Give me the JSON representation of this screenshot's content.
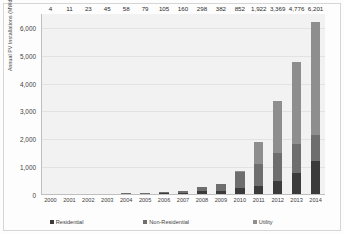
{
  "chart_data": {
    "type": "bar",
    "subtype": "stacked-bar",
    "title": "",
    "xlabel": "",
    "ylabel": "Annual PV Installations (MWdc)",
    "ylim": [
      0,
      6500
    ],
    "yticks": [
      0,
      1000,
      2000,
      3000,
      4000,
      5000,
      6000
    ],
    "ytick_labels": [
      "0",
      "1,000",
      "2,000",
      "3,000",
      "4,000",
      "5,000",
      "6,000"
    ],
    "grid": true,
    "legend_position": "bottom",
    "categories": [
      "2000",
      "2001",
      "2002",
      "2003",
      "2004",
      "2005",
      "2006",
      "2007",
      "2008",
      "2009",
      "2010",
      "2011",
      "2012",
      "2013",
      "2014"
    ],
    "totals": [
      4,
      11,
      23,
      45,
      58,
      79,
      105,
      160,
      298,
      382,
      852,
      1922,
      3369,
      4776,
      6201
    ],
    "total_labels": [
      "4",
      "11",
      "23",
      "45",
      "58",
      "79",
      "105",
      "160",
      "298",
      "382",
      "852",
      "1,922",
      "3,369",
      "4,776",
      "6,201"
    ],
    "series": [
      {
        "name": "Residential",
        "color": "#3b3b3b",
        "values": [
          2,
          6,
          13,
          24,
          32,
          43,
          56,
          78,
          130,
          162,
          253,
          318,
          498,
          779,
          1231
        ]
      },
      {
        "name": "Non-Residential",
        "color": "#6e6e6e",
        "values": [
          2,
          5,
          10,
          21,
          26,
          36,
          49,
          82,
          168,
          220,
          561,
          791,
          1008,
          1060,
          925
        ]
      },
      {
        "name": "Utility",
        "color": "#8e8e8e",
        "values": [
          0,
          0,
          0,
          0,
          0,
          0,
          0,
          0,
          0,
          0,
          38,
          813,
          1863,
          2937,
          4045
        ]
      }
    ],
    "legend": [
      "Residential",
      "Non-Residential",
      "Utility"
    ]
  },
  "colors": {
    "plot_background": "#f2f2f2",
    "gridline": "#e2e2e2",
    "axis": "#bfbfbf",
    "text": "#3d3d3d",
    "label_text": "#2b2b2b",
    "frame": "#d6d6d6",
    "page_background": "#fdfdfd"
  }
}
